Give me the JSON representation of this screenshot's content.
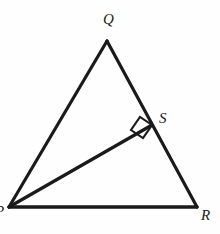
{
  "figure": {
    "type": "geometry-diagram",
    "background_color": "#fefefe",
    "stroke_color": "#1a1a1a",
    "label_color": "#1a1a1a",
    "stroke_width_px": 3,
    "right_angle_stroke_width_px": 2,
    "canvas": {
      "width": 220,
      "height": 234
    }
  },
  "labels": {
    "Q": "Q",
    "S": "S",
    "R": "R",
    "P": "P"
  },
  "points": {
    "P": {
      "x": 9,
      "y": 207
    },
    "Q": {
      "x": 107,
      "y": 41
    },
    "R": {
      "x": 197,
      "y": 207
    },
    "S": {
      "x": 152,
      "y": 125
    }
  },
  "segments": [
    {
      "name": "PQ",
      "from": "P",
      "to": "Q"
    },
    {
      "name": "QR",
      "from": "Q",
      "to": "R"
    },
    {
      "name": "PR",
      "from": "P",
      "to": "R"
    },
    {
      "name": "PS",
      "from": "P",
      "to": "S"
    }
  ],
  "right_angle": {
    "at": "S",
    "marker": "square",
    "size_px": 15,
    "points": "152,125 140,117 131,130 143,138"
  }
}
